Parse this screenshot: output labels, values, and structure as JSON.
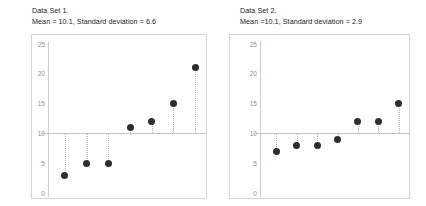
{
  "figure": {
    "background": "#ffffff",
    "dot_color": "#2e2e2e",
    "axis_color": "#cfcfcf",
    "frame_color": "#d5d5d5"
  },
  "chart_data": [
    {
      "type": "scatter",
      "title": "Data Set 1.",
      "subtitle": "Mean = 10.1, Standard deviation = 6.6",
      "xlabel": "",
      "ylabel": "",
      "ylim": [
        0,
        25
      ],
      "yticks": [
        0,
        5,
        10,
        15,
        20,
        25
      ],
      "ytick_labels": [
        "0",
        "5",
        "10",
        "15",
        "20",
        "25"
      ],
      "grid": false,
      "legend": "none",
      "mean": 10.1,
      "std": 6.6,
      "reference_line": 10.1,
      "x": [
        1,
        2,
        3,
        4,
        5,
        6,
        7
      ],
      "values": [
        3,
        5,
        5,
        11,
        12,
        15,
        21
      ],
      "annotations": [
        "dotted stems drawn from mean reference line to each point"
      ]
    },
    {
      "type": "scatter",
      "title": "Data Set 2.",
      "subtitle": "Mean =10.1, Standard deviation = 2.9",
      "xlabel": "",
      "ylabel": "",
      "ylim": [
        0,
        25
      ],
      "yticks": [
        0,
        5,
        10,
        15,
        20,
        25
      ],
      "ytick_labels": [
        "0",
        "5",
        "10",
        "15",
        "20",
        "25"
      ],
      "grid": false,
      "legend": "none",
      "mean": 10.1,
      "std": 2.9,
      "reference_line": 10.1,
      "x": [
        1,
        2,
        3,
        4,
        5,
        6,
        7
      ],
      "values": [
        7,
        8,
        8,
        9,
        12,
        12,
        15
      ],
      "annotations": [
        "dotted stems drawn from mean reference line to each point"
      ]
    }
  ]
}
